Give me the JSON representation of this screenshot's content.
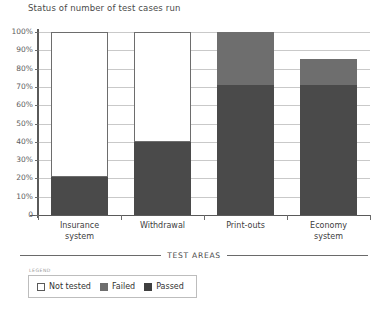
{
  "chart_data": {
    "type": "bar",
    "title": "Status of number of test cases run",
    "xlabel": "TEST AREAS",
    "ylabel": "",
    "stacked": true,
    "grid": true,
    "legend_position": "bottom-left",
    "ylim": [
      0,
      100
    ],
    "ytick_labels": [
      "100%",
      "90%",
      "80%",
      "70%",
      "60%",
      "50%",
      "40%",
      "30%",
      "20%",
      "10%",
      "0"
    ],
    "ytick_values": [
      100,
      90,
      80,
      70,
      60,
      50,
      40,
      30,
      20,
      10,
      0
    ],
    "categories": [
      "Insurance\nsystem",
      "Withdrawal",
      "Print-outs",
      "Economy\nsystem"
    ],
    "series": [
      {
        "name": "Passed",
        "color": "#4a4a4a",
        "values": [
          21,
          40,
          71,
          71
        ]
      },
      {
        "name": "Failed",
        "color": "#6e6e6e",
        "values": [
          0,
          0,
          29,
          14
        ]
      },
      {
        "name": "Not tested",
        "color": "#ffffff",
        "values": [
          79,
          60,
          0,
          0
        ]
      }
    ]
  },
  "legend": {
    "caption": "LEGEND",
    "items": [
      {
        "label": "Not tested",
        "swatch": "nottested"
      },
      {
        "label": "Failed",
        "swatch": "failed"
      },
      {
        "label": "Passed",
        "swatch": "passed"
      }
    ]
  }
}
